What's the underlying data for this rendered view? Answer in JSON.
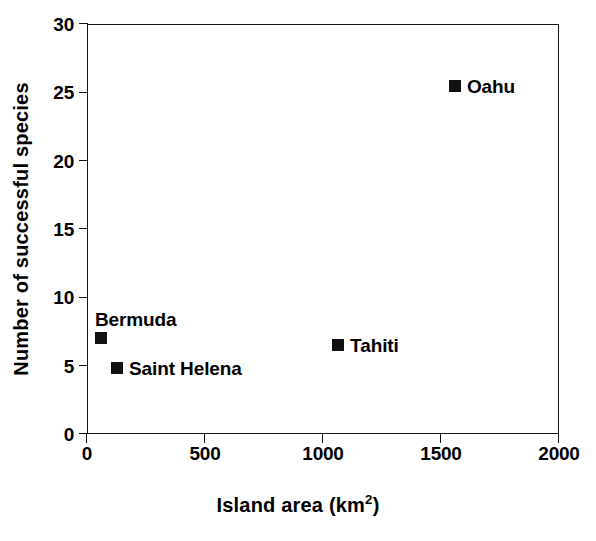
{
  "chart_data": {
    "type": "scatter",
    "title": "",
    "xlabel": "Island area (km2)",
    "xlabel_base": "Island area (km",
    "xlabel_sup": "2",
    "xlabel_tail": ")",
    "ylabel": "Number of successful species",
    "xlim": [
      0,
      2000
    ],
    "ylim": [
      0,
      30
    ],
    "xticks": [
      0,
      500,
      1000,
      1500,
      2000
    ],
    "xticklabels": [
      "0",
      "500",
      "1000",
      "1500",
      "2000"
    ],
    "yticks": [
      0,
      5,
      10,
      15,
      20,
      25,
      30
    ],
    "yticklabels": [
      "0",
      "5",
      "10",
      "15",
      "20",
      "25",
      "30"
    ],
    "grid": false,
    "legend": "none",
    "marker_color": "#111111",
    "marker_shape": "square",
    "frame": "box",
    "points": [
      {
        "label": "Bermuda",
        "x": 59,
        "y": 7.0,
        "label_pos": "above-left"
      },
      {
        "label": "Saint Helena",
        "x": 127,
        "y": 4.8,
        "label_pos": "right"
      },
      {
        "label": "Tahiti",
        "x": 1064,
        "y": 6.5,
        "label_pos": "right"
      },
      {
        "label": "Oahu",
        "x": 1559,
        "y": 25.5,
        "label_pos": "right"
      }
    ]
  }
}
